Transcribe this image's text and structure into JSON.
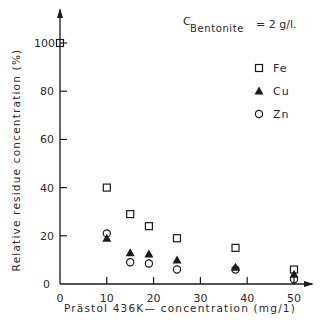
{
  "chart_data": {
    "type": "scatter",
    "title": "",
    "annotation": {
      "symbol": "C",
      "subscript": "Bentonite",
      "value": "= 2 g/l."
    },
    "xlabel": "Prästol 436K— concentration (mg/1)",
    "ylabel": "Relative residue concentration (%)",
    "xlim": [
      0,
      53
    ],
    "ylim": [
      0,
      110
    ],
    "x_ticks": [
      0,
      10,
      20,
      30,
      40,
      50
    ],
    "y_ticks": [
      0,
      20,
      40,
      60,
      80,
      100
    ],
    "x_tick_labels": [
      "0",
      "10",
      "20",
      "30",
      "40",
      "50"
    ],
    "y_tick_labels": [
      "0",
      "20",
      "40",
      "60",
      "80",
      "100"
    ],
    "grid": false,
    "legend_position": "upper right",
    "series": [
      {
        "name": "Fe",
        "marker": "open-square",
        "x": [
          0,
          10,
          15,
          19,
          25,
          37.5,
          50
        ],
        "values": [
          100,
          40,
          29,
          24,
          19,
          15,
          6
        ]
      },
      {
        "name": "Cu",
        "marker": "filled-triangle",
        "x": [
          10,
          15,
          19,
          25,
          37.5,
          50
        ],
        "values": [
          19,
          13,
          12.5,
          10,
          7,
          4
        ]
      },
      {
        "name": "Zn",
        "marker": "open-circle",
        "x": [
          10,
          15,
          19,
          25,
          37.5,
          50
        ],
        "values": [
          21,
          9,
          8.5,
          6,
          6,
          2
        ]
      }
    ]
  },
  "colors": {
    "ink": "#1a1a1a",
    "background": "#ffffff"
  }
}
